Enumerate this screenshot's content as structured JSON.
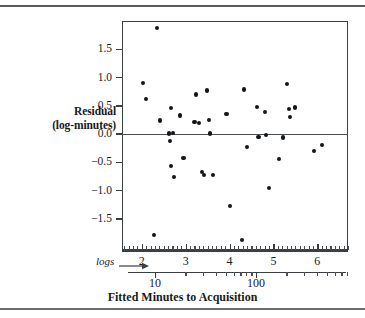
{
  "figure": {
    "y_axis_label_line1": "Residual",
    "y_axis_label_line2": "(log-minutes)",
    "x_axis_title": "Fitted Minutes to Acquisition",
    "logs_note": "logs",
    "arrow_icon": "right-arrow-icon"
  },
  "chart_data": {
    "type": "scatter",
    "title": "",
    "xlabel": "Fitted Minutes to Acquisition",
    "ylabel": "Residual (log-minutes)",
    "xlim": [
      1.55,
      6.7
    ],
    "ylim": [
      -2.05,
      2.0
    ],
    "grid": false,
    "legend": null,
    "zero_reference_line": 0.0,
    "x_scale_note": "logs",
    "y_ticks": [
      1.5,
      1.0,
      0.5,
      0.0,
      -0.5,
      -1.0,
      -1.5
    ],
    "y_tick_labels": [
      "1.5",
      "1.0",
      "0.5",
      "0.0",
      "-0.5",
      "-1.0",
      "-1.5"
    ],
    "x_ticks_log": [
      2,
      3,
      4,
      5,
      6
    ],
    "x_tick_labels_log": [
      "2",
      "3",
      "4",
      "5",
      "6"
    ],
    "x_ticks_raw": [
      10,
      100
    ],
    "x_tick_labels_raw": [
      "10",
      "100"
    ],
    "x_minor_tick_step": 0.1,
    "point_color": "#141618",
    "axis_color": "#3a3f44",
    "points": [
      {
        "x": 2.03,
        "y": 0.9
      },
      {
        "x": 2.1,
        "y": 0.62
      },
      {
        "x": 2.34,
        "y": 1.87
      },
      {
        "x": 2.28,
        "y": -1.78
      },
      {
        "x": 2.42,
        "y": 0.24
      },
      {
        "x": 2.66,
        "y": 0.46
      },
      {
        "x": 2.63,
        "y": 0.01
      },
      {
        "x": 2.65,
        "y": -0.12
      },
      {
        "x": 2.71,
        "y": 0.02
      },
      {
        "x": 2.67,
        "y": -0.57
      },
      {
        "x": 2.73,
        "y": -0.76
      },
      {
        "x": 2.87,
        "y": 0.33
      },
      {
        "x": 2.95,
        "y": -0.43
      },
      {
        "x": 3.2,
        "y": 0.22
      },
      {
        "x": 3.24,
        "y": 0.7
      },
      {
        "x": 3.31,
        "y": 0.19
      },
      {
        "x": 3.37,
        "y": -0.67
      },
      {
        "x": 3.42,
        "y": -0.72
      },
      {
        "x": 3.48,
        "y": 0.77
      },
      {
        "x": 3.53,
        "y": 0.25
      },
      {
        "x": 3.56,
        "y": 0.01
      },
      {
        "x": 3.62,
        "y": -0.72
      },
      {
        "x": 3.93,
        "y": 0.35
      },
      {
        "x": 4.02,
        "y": -1.27
      },
      {
        "x": 4.29,
        "y": -1.87
      },
      {
        "x": 4.33,
        "y": 0.79
      },
      {
        "x": 4.4,
        "y": -0.23
      },
      {
        "x": 4.63,
        "y": 0.48
      },
      {
        "x": 4.66,
        "y": -0.05
      },
      {
        "x": 4.8,
        "y": 0.39
      },
      {
        "x": 4.84,
        "y": -0.02
      },
      {
        "x": 4.9,
        "y": -0.95
      },
      {
        "x": 5.13,
        "y": -0.44
      },
      {
        "x": 5.22,
        "y": -0.06
      },
      {
        "x": 5.31,
        "y": 0.88
      },
      {
        "x": 5.36,
        "y": 0.44
      },
      {
        "x": 5.38,
        "y": 0.3
      },
      {
        "x": 5.5,
        "y": 0.47
      },
      {
        "x": 5.93,
        "y": -0.3
      },
      {
        "x": 6.1,
        "y": -0.19
      }
    ]
  }
}
